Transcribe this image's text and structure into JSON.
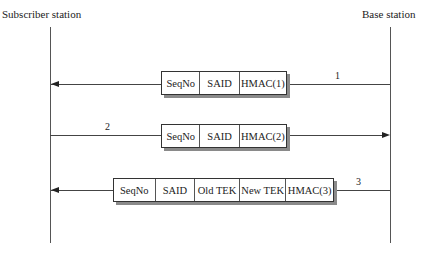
{
  "actors": {
    "left": "Subscriber station",
    "right": "Base station"
  },
  "messages": [
    {
      "number": "1",
      "direction": "base-to-subscriber",
      "fields": [
        "SeqNo",
        "SAID",
        "HMAC(1)"
      ]
    },
    {
      "number": "2",
      "direction": "subscriber-to-base",
      "fields": [
        "SeqNo",
        "SAID",
        "HMAC(2)"
      ]
    },
    {
      "number": "3",
      "direction": "base-to-subscriber",
      "fields": [
        "SeqNo",
        "SAID",
        "Old TEK",
        "New TEK",
        "HMAC(3)"
      ]
    }
  ],
  "colors": {
    "line": "#444444",
    "shadow": "#8a8a8a",
    "background": "#ffffff"
  }
}
